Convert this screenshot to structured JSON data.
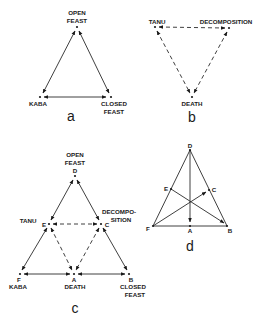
{
  "figure": {
    "panels": [
      {
        "id": "a",
        "caption": "a",
        "nodes": [
          {
            "key": "open_feast",
            "lines": [
              "OPEN",
              "FEAST"
            ]
          },
          {
            "key": "kaba",
            "lines": [
              "KABA"
            ]
          },
          {
            "key": "closed_feast",
            "lines": [
              "CLOSED",
              "FEAST"
            ]
          }
        ],
        "edges": [
          {
            "from": "kaba",
            "to": "open_feast",
            "style": "solid",
            "arrows": "both"
          },
          {
            "from": "open_feast",
            "to": "closed_feast",
            "style": "solid",
            "arrows": "both"
          },
          {
            "from": "kaba",
            "to": "closed_feast",
            "style": "solid",
            "arrows": "both"
          }
        ]
      },
      {
        "id": "b",
        "caption": "b",
        "nodes": [
          {
            "key": "tanu",
            "lines": [
              "TANU"
            ]
          },
          {
            "key": "decomposition",
            "lines": [
              "DECOMPOSITION"
            ]
          },
          {
            "key": "death",
            "lines": [
              "DEATH"
            ]
          }
        ],
        "edges": [
          {
            "from": "tanu",
            "to": "decomposition",
            "style": "dashed",
            "arrows": "both"
          },
          {
            "from": "tanu",
            "to": "death",
            "style": "dashed",
            "arrows": "both"
          },
          {
            "from": "decomposition",
            "to": "death",
            "style": "dashed",
            "arrows": "both"
          }
        ]
      },
      {
        "id": "c",
        "caption": "c",
        "nodes": [
          {
            "key": "D",
            "letter": "D",
            "lines": [
              "OPEN",
              "FEAST"
            ]
          },
          {
            "key": "E",
            "letter": "E",
            "lines": [
              "TANU"
            ]
          },
          {
            "key": "C",
            "letter": "C",
            "lines": [
              "DECOMPO-",
              "SITION"
            ]
          },
          {
            "key": "F",
            "letter": "F",
            "lines": [
              "KABA"
            ]
          },
          {
            "key": "A",
            "letter": "A",
            "lines": [
              "DEATH"
            ]
          },
          {
            "key": "B",
            "letter": "B",
            "lines": [
              "CLOSED",
              "FEAST"
            ]
          }
        ],
        "edges": [
          {
            "from": "D",
            "to": "E",
            "style": "solid",
            "arrows": "both"
          },
          {
            "from": "E",
            "to": "F",
            "style": "solid",
            "arrows": "both"
          },
          {
            "from": "D",
            "to": "C",
            "style": "solid",
            "arrows": "both"
          },
          {
            "from": "C",
            "to": "B",
            "style": "solid",
            "arrows": "both"
          },
          {
            "from": "F",
            "to": "A",
            "style": "solid",
            "arrows": "both"
          },
          {
            "from": "A",
            "to": "B",
            "style": "solid",
            "arrows": "both"
          },
          {
            "from": "E",
            "to": "C",
            "style": "dashed",
            "arrows": "both"
          },
          {
            "from": "E",
            "to": "A",
            "style": "dashed",
            "arrows": "both"
          },
          {
            "from": "C",
            "to": "A",
            "style": "dashed",
            "arrows": "both"
          }
        ]
      },
      {
        "id": "d",
        "caption": "d",
        "nodes": [
          {
            "key": "D",
            "letter": "D"
          },
          {
            "key": "E",
            "letter": "E"
          },
          {
            "key": "C",
            "letter": "C"
          },
          {
            "key": "F",
            "letter": "F"
          },
          {
            "key": "A",
            "letter": "A"
          },
          {
            "key": "B",
            "letter": "B"
          }
        ],
        "edges": [
          {
            "from": "D",
            "to": "F",
            "style": "solid",
            "arrows": "none"
          },
          {
            "from": "D",
            "to": "B",
            "style": "solid",
            "arrows": "none"
          },
          {
            "from": "F",
            "to": "B",
            "style": "solid",
            "arrows": "none"
          },
          {
            "from": "D",
            "to": "A",
            "style": "solid",
            "arrows": "end"
          },
          {
            "from": "E",
            "to": "B",
            "style": "solid",
            "arrows": "end"
          },
          {
            "from": "F",
            "to": "C",
            "style": "solid",
            "arrows": "end"
          }
        ]
      }
    ]
  }
}
